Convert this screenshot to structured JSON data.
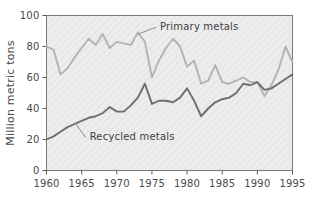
{
  "chart_data": {
    "type": "line",
    "title": "",
    "xlabel": "",
    "ylabel": "Million metric tons",
    "xlim": [
      1960,
      1995
    ],
    "ylim": [
      0,
      100
    ],
    "xticks": [
      1960,
      1965,
      1970,
      1975,
      1980,
      1985,
      1990,
      1995
    ],
    "yticks": [
      0,
      20,
      40,
      60,
      80,
      100
    ],
    "xtick_labels": [
      "1960",
      "1965",
      "1970",
      "1975",
      "1980",
      "1985",
      "1990",
      "1995"
    ],
    "ytick_labels": [
      "0",
      "20",
      "40",
      "60",
      "80",
      "100"
    ],
    "grid": false,
    "legend_position": "inline-annotation",
    "plot_background": "#ededed",
    "x": [
      1960,
      1961,
      1962,
      1963,
      1964,
      1965,
      1966,
      1967,
      1968,
      1969,
      1970,
      1971,
      1972,
      1973,
      1974,
      1975,
      1976,
      1977,
      1978,
      1979,
      1980,
      1981,
      1982,
      1983,
      1984,
      1985,
      1986,
      1987,
      1988,
      1989,
      1990,
      1991,
      1992,
      1993,
      1994,
      1995
    ],
    "series": [
      {
        "name": "Primary metals",
        "color": "#b3b3b3",
        "label": "Primary metals",
        "values": [
          80,
          78,
          62,
          66,
          73,
          79,
          85,
          81,
          88,
          79,
          83,
          82,
          81,
          89,
          83,
          60,
          71,
          79,
          85,
          80,
          67,
          71,
          56,
          58,
          68,
          57,
          56,
          58,
          60,
          57,
          57,
          48,
          55,
          65,
          80,
          70
        ]
      },
      {
        "name": "Recycled metals",
        "color": "#6e6e6e",
        "label": "Recycled metals",
        "values": [
          20,
          22,
          25,
          28,
          30,
          32,
          34,
          35,
          37,
          41,
          38,
          38,
          42,
          47,
          56,
          43,
          45,
          45,
          44,
          47,
          53,
          45,
          35,
          40,
          44,
          46,
          47,
          50,
          56,
          55,
          57,
          52,
          53,
          56,
          59,
          62
        ]
      }
    ],
    "annotations": [
      {
        "text": "Primary metals",
        "x_value": 1976,
        "y_value": 93,
        "leader_to_x": 1973,
        "leader_to_y": 88
      },
      {
        "text": "Recycled metals",
        "x_value": 1966,
        "y_value": 22,
        "leader_to_x": 1964,
        "leader_to_y": 31
      }
    ]
  }
}
